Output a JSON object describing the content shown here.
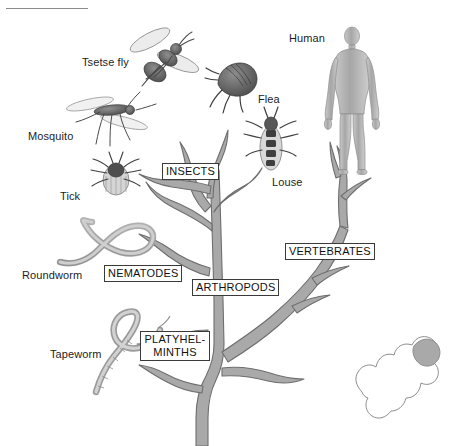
{
  "figure": {
    "type": "phylogenetic-tree-diagram",
    "background_color": "#ffffff",
    "tree_fill_color": "#a9a9a9",
    "tree_stroke_color": "#6e6e6e",
    "label_text_color": "#111111",
    "rule_color": "#8b8b8b"
  },
  "clade_labels": [
    {
      "id": "insects",
      "text": "INSECTS",
      "x": 162,
      "y": 163,
      "lines": [
        "INSECTS"
      ]
    },
    {
      "id": "vertebrates",
      "text": "VERTEBRATES",
      "x": 285,
      "y": 243,
      "lines": [
        "VERTEBRATES"
      ]
    },
    {
      "id": "nematodes",
      "text": "NEMATODES",
      "x": 104,
      "y": 265,
      "lines": [
        "NEMATODES"
      ]
    },
    {
      "id": "arthropods",
      "text": "ARTHROPODS",
      "x": 192,
      "y": 279,
      "lines": [
        "ARTHROPODS"
      ]
    },
    {
      "id": "platyhelminths",
      "text": "PLATYHEL- MINTHS",
      "x": 140,
      "y": 331,
      "lines": [
        "PLATYHEL-",
        "MINTHS"
      ]
    }
  ],
  "organisms": [
    {
      "id": "tsetse-fly",
      "label": "Tsetse fly",
      "label_x": 82,
      "label_y": 56,
      "art_x": 128,
      "art_y": 26,
      "art_w": 72,
      "art_h": 60
    },
    {
      "id": "mosquito",
      "label": "Mosquito",
      "label_x": 28,
      "label_y": 130,
      "art_x": 58,
      "art_y": 92,
      "art_w": 92,
      "art_h": 56
    },
    {
      "id": "tick",
      "label": "Tick",
      "label_x": 60,
      "label_y": 190,
      "art_x": 92,
      "art_y": 155,
      "art_w": 48,
      "art_h": 42
    },
    {
      "id": "flea",
      "label": "Flea",
      "label_x": 258,
      "label_y": 93,
      "art_x": 212,
      "art_y": 62,
      "art_w": 50,
      "art_h": 44
    },
    {
      "id": "louse",
      "label": "Louse",
      "label_x": 272,
      "label_y": 176,
      "art_x": 248,
      "art_y": 116,
      "art_w": 46,
      "art_h": 62
    },
    {
      "id": "human",
      "label": "Human",
      "label_x": 289,
      "label_y": 32,
      "art_x": 330,
      "art_y": 27,
      "art_w": 44,
      "art_h": 120
    },
    {
      "id": "roundworm",
      "label": "Roundworm",
      "label_x": 22,
      "label_y": 269,
      "art_x": 58,
      "art_y": 218,
      "art_w": 96,
      "art_h": 56
    },
    {
      "id": "tapeworm",
      "label": "Tapeworm",
      "label_x": 50,
      "label_y": 348,
      "art_x": 88,
      "art_y": 310,
      "art_w": 86,
      "art_h": 86
    }
  ],
  "inset": {
    "id": "tree-silhouette-inset",
    "description": "white tree-shape outline with one shaded tip",
    "x": 352,
    "y": 325,
    "w": 92,
    "h": 96,
    "outline_color": "#8e8e8e",
    "shaded_tip_color": "#a9a9a9"
  }
}
